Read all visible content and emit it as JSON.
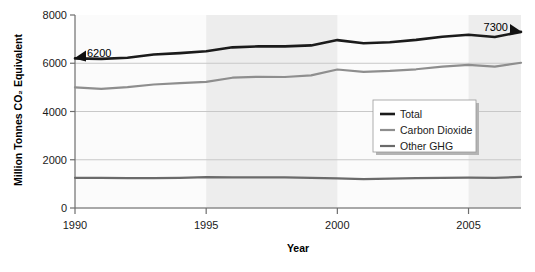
{
  "chart_data": {
    "type": "line",
    "title": "",
    "xlabel": "Year",
    "ylabel": "Million Tonnes CO₂ Equivalent",
    "xlim": [
      1990,
      2007
    ],
    "ylim": [
      0,
      8000
    ],
    "xticks": [
      1990,
      1995,
      2000,
      2005
    ],
    "yticks": [
      0,
      2000,
      4000,
      6000,
      8000
    ],
    "grid": "horizontal",
    "legend_position": "center-right",
    "x": [
      1990,
      1991,
      1992,
      1993,
      1994,
      1995,
      1996,
      1997,
      1998,
      1999,
      2000,
      2001,
      2002,
      2003,
      2004,
      2005,
      2006,
      2007
    ],
    "series": [
      {
        "name": "Total",
        "color": "#1b1b1b",
        "values": [
          6200,
          6180,
          6230,
          6360,
          6420,
          6500,
          6660,
          6700,
          6700,
          6740,
          6960,
          6830,
          6870,
          6970,
          7100,
          7180,
          7090,
          7300
        ]
      },
      {
        "name": "Carbon Dioxide",
        "color": "#8e8e8e",
        "values": [
          5000,
          4940,
          5010,
          5120,
          5180,
          5230,
          5400,
          5440,
          5430,
          5500,
          5740,
          5640,
          5680,
          5750,
          5860,
          5930,
          5860,
          6020
        ]
      },
      {
        "name": "Other GHG",
        "color": "#6a6a6a",
        "values": [
          1250,
          1250,
          1240,
          1240,
          1250,
          1280,
          1270,
          1270,
          1270,
          1250,
          1230,
          1200,
          1220,
          1240,
          1250,
          1260,
          1250,
          1290
        ]
      }
    ],
    "annotations": [
      {
        "label": "6200",
        "x": 1990,
        "y": 6200,
        "marker": "left-triangle"
      },
      {
        "label": "7300",
        "x": 2007,
        "y": 7300,
        "marker": "right-triangle"
      }
    ],
    "legend_entries": [
      {
        "label": "Total",
        "color": "#1b1b1b"
      },
      {
        "label": "Carbon Dioxide",
        "color": "#8e8e8e"
      },
      {
        "label": "Other GHG",
        "color": "#6a6a6a"
      }
    ]
  }
}
